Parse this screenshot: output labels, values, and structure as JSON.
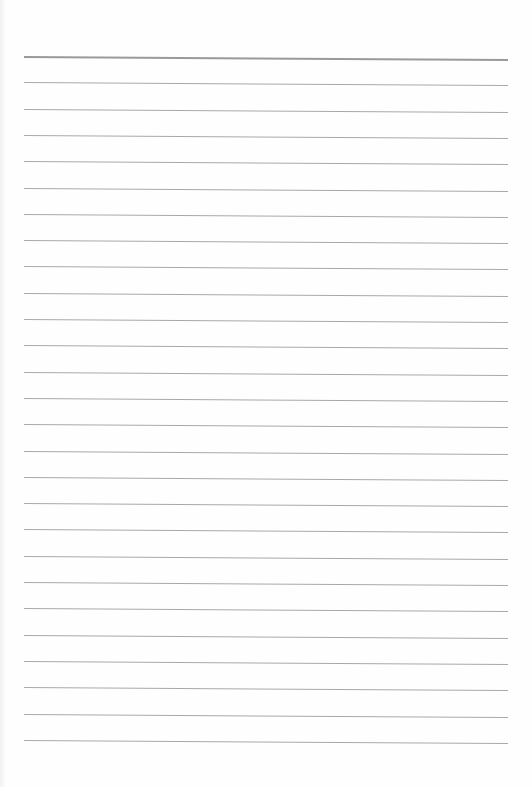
{
  "page": {
    "type": "lined-paper",
    "background_color": "#fefefe",
    "rule_color": "#a9a9a9",
    "header_rule_color": "#9a9a9a",
    "rule_count": 27,
    "first_rule_y": 56,
    "rule_spacing": 26.3,
    "rule_left": 24,
    "rule_right": 508
  }
}
